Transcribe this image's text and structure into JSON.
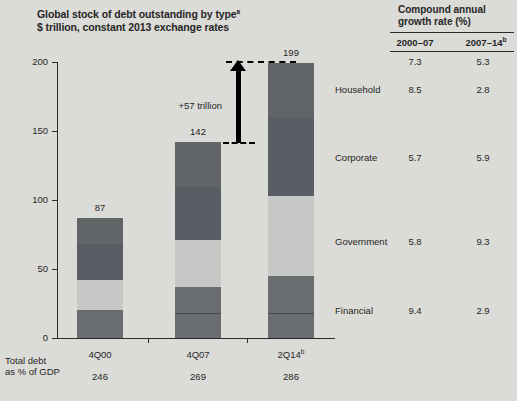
{
  "page": {
    "background": "#dbdbd7"
  },
  "chart": {
    "title_line1": "Global stock of debt outstanding by type",
    "title_sup": "a",
    "title_line2": "$ trillion, constant 2013 exchange rates",
    "arrow_label": "+57 trillion",
    "gdp_label_line1": "Total debt",
    "gdp_label_line2": "as % of GDP"
  },
  "growth_table": {
    "header_line1": "Compound annual",
    "header_line2": "growth rate (%)",
    "col1_label": "2000–07",
    "col2_label": "2007–14",
    "col2_sup": "b",
    "rows": [
      {
        "label": "",
        "v1": "7.3",
        "v2": "5.3"
      },
      {
        "label": "Household",
        "v1": "8.5",
        "v2": "2.8"
      },
      {
        "label": "Corporate",
        "v1": "5.7",
        "v2": "5.9"
      },
      {
        "label": "Government",
        "v1": "5.8",
        "v2": "9.3"
      },
      {
        "label": "Financial",
        "v1": "9.4",
        "v2": "2.9"
      }
    ]
  },
  "chart_data": {
    "type": "bar",
    "subtype": "stacked",
    "title": "Global stock of debt outstanding by type",
    "units": "$ trillion, constant 2013 exchange rates",
    "categories": [
      "4Q00",
      "4Q07",
      "2Q14"
    ],
    "category_sups": [
      "",
      "",
      "b"
    ],
    "series": [
      {
        "name": "Financial",
        "color": "#696d70",
        "values": [
          20,
          37,
          45
        ]
      },
      {
        "name": "Government",
        "color": "#c6c8c6",
        "values": [
          22,
          34,
          58
        ]
      },
      {
        "name": "Corporate",
        "color": "#585e63",
        "values": [
          26,
          38,
          56
        ]
      },
      {
        "name": "Household",
        "color": "#616568",
        "values": [
          19,
          33,
          40
        ]
      }
    ],
    "stack_order_bottom_to_top": [
      "Financial",
      "Government",
      "Corporate",
      "Household"
    ],
    "totals": [
      "87",
      "142",
      "199"
    ],
    "total_debt_pct_gdp": [
      "246",
      "269",
      "286"
    ],
    "annotation": {
      "text": "+57 trillion",
      "from_total": 142,
      "to_total": 199
    },
    "ylabel": "",
    "xlabel": "",
    "ylim": [
      0,
      200
    ],
    "y_ticks": [
      0,
      50,
      100,
      150,
      200
    ],
    "grid": false,
    "legend_position": "right-table-labels"
  }
}
